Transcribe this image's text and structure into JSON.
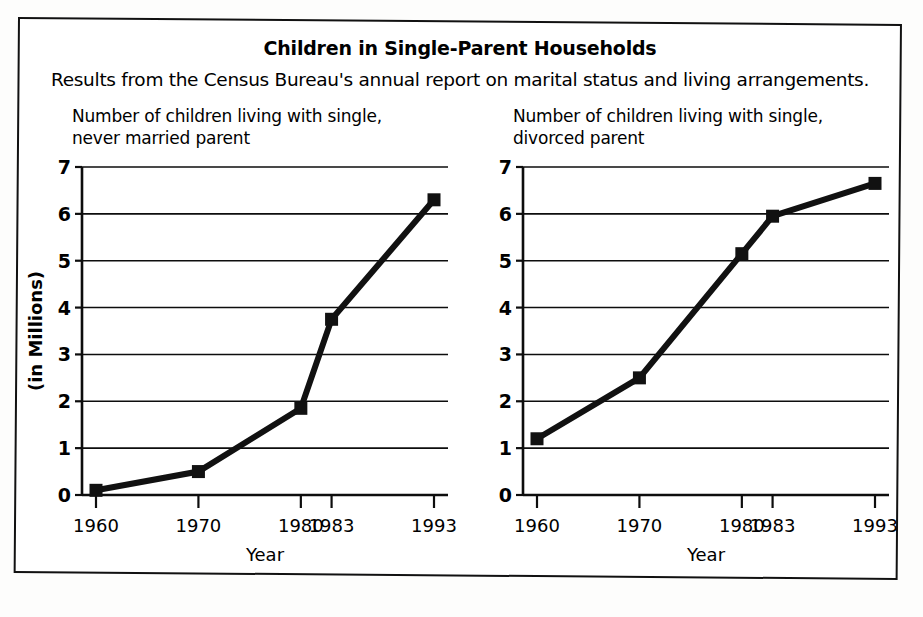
{
  "document": {
    "title": "Children in Single-Parent Households",
    "subtitle": "Results from the Census Bureau's annual report on marital status and living arrangements."
  },
  "chart_data": [
    {
      "type": "line",
      "panel": "left",
      "title": "Number of children living with single,\nnever married parent",
      "title_line1": "Number of children living with single,",
      "title_line2": "never married parent",
      "xlabel": "Year",
      "ylabel": "(in Millions)",
      "categories": [
        "1960",
        "1970",
        "1980",
        "1983",
        "1993"
      ],
      "category_positions": [
        1960,
        1970,
        1980,
        1983,
        1993
      ],
      "values": [
        0.1,
        0.5,
        1.85,
        3.75,
        6.3
      ],
      "ylim": [
        0,
        7
      ],
      "yticks": [
        "0",
        "1",
        "2",
        "3",
        "4",
        "5",
        "6",
        "7"
      ],
      "ytick_values": [
        0,
        1,
        2,
        3,
        4,
        5,
        6,
        7
      ],
      "grid": true,
      "legend": "none",
      "marker": "square",
      "line_color": "#111111"
    },
    {
      "type": "line",
      "panel": "right",
      "title": "Number of children living with single,\ndivorced parent",
      "title_line1": "Number of children living with single,",
      "title_line2": "divorced parent",
      "xlabel": "Year",
      "ylabel": "",
      "categories": [
        "1960",
        "1970",
        "1980",
        "1983",
        "1993"
      ],
      "category_positions": [
        1960,
        1970,
        1980,
        1983,
        1993
      ],
      "values": [
        1.2,
        2.5,
        5.15,
        5.95,
        6.65
      ],
      "ylim": [
        0,
        7
      ],
      "yticks": [
        "0",
        "1",
        "2",
        "3",
        "4",
        "5",
        "6",
        "7"
      ],
      "ytick_values": [
        0,
        1,
        2,
        3,
        4,
        5,
        6,
        7
      ],
      "grid": true,
      "legend": "none",
      "marker": "square",
      "line_color": "#111111"
    }
  ]
}
